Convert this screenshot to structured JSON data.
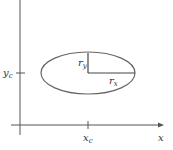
{
  "diagram": {
    "type": "ellipse-parameters",
    "center": {
      "x_label": "x",
      "x_sub": "c",
      "y_label": "y",
      "y_sub": "c"
    },
    "radii": {
      "rx_label": "r",
      "rx_sub": "x",
      "ry_label": "r",
      "ry_sub": "y"
    },
    "axis_label_x": "x",
    "colors": {
      "stroke": "#555555",
      "text": "#333333",
      "background": "#ffffff"
    }
  }
}
